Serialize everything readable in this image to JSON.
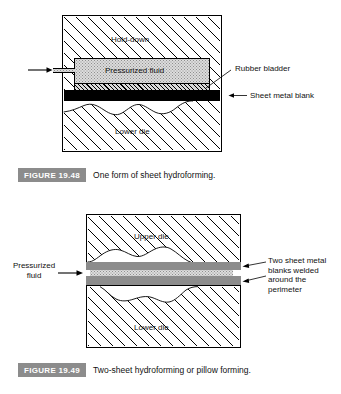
{
  "page": {
    "background": "#ffffff",
    "width": 341,
    "height": 394
  },
  "figures": [
    {
      "id": "figure-19-48",
      "caption_label": "FIGURE 19.48",
      "caption_text": "One form of sheet hydroforming.",
      "parts": {
        "hold_down": "Hold-down",
        "pressurized_fluid": "Pressurized fluid",
        "lower_die": "Lower die",
        "rubber_bladder": "Rubber bladder",
        "sheet_metal_blank": "Sheet metal blank"
      }
    },
    {
      "id": "figure-19-49",
      "caption_label": "FIGURE 19.49",
      "caption_text": "Two-sheet hydroforming or pillow forming.",
      "parts": {
        "upper_die": "Upper die",
        "lower_die": "Lower die",
        "pressurized_fluid_line1": "Pressurized",
        "pressurized_fluid_line2": "fluid",
        "blanks_line1": "Two sheet metal",
        "blanks_line2": "blanks welded",
        "blanks_line3": "around the",
        "blanks_line4": "perimeter"
      }
    }
  ],
  "colors": {
    "caption_badge_bg": "#8c8c8c",
    "caption_badge_text": "#ffffff",
    "ink": "#000000",
    "fluid_fill": "#dcdcdc",
    "sheet_gray": "#8c8c8c",
    "blank_black": "#000000"
  }
}
